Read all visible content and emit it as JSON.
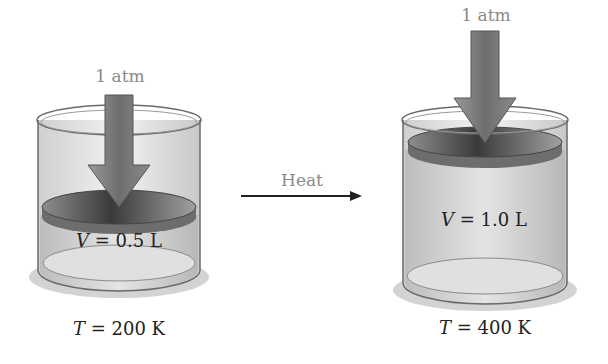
{
  "left": {
    "pressure_label": "1 atm",
    "volume_var": "V",
    "volume_value": " = 0.5 L",
    "temp_var": "T",
    "temp_value": " = 200 K"
  },
  "process": {
    "label": "Heat"
  },
  "right": {
    "pressure_label": "1 atm",
    "volume_var": "V",
    "volume_value": " = 1.0 L",
    "temp_var": "T",
    "temp_value": " = 400 K"
  },
  "colors": {
    "arrow": "#7a7a7a",
    "piston": "#5a5a5a",
    "gas": "#d6d6d6",
    "text_gray": "#8a8a8a"
  }
}
